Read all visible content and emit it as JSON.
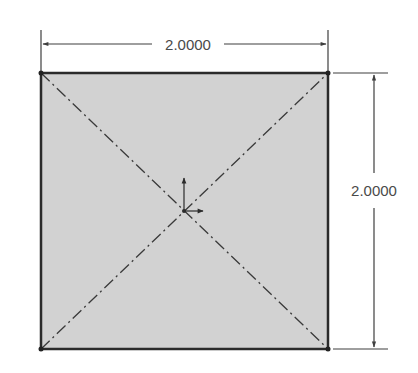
{
  "sketch": {
    "shape": "square",
    "fill_color": "#d2d2d2",
    "edge_color": "#2b2b2b",
    "construction_line_color": "#3a3a3a",
    "dimension_color": "#3f3f3f",
    "dimensions": {
      "horizontal": {
        "label": "2.0000",
        "value": 2.0
      },
      "vertical": {
        "label": "2.0000",
        "value": 2.0
      }
    },
    "construction_lines": [
      "diagonal-top-left-to-bottom-right",
      "diagonal-bottom-left-to-top-right"
    ],
    "origin_marker": "coordinate-origin"
  }
}
